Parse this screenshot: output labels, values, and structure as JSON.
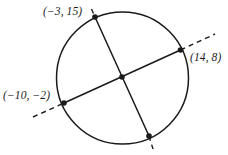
{
  "figure": {
    "name": "circle-with-two-chords",
    "stroke_color": "#1a1a1a",
    "background_color": "#ffffff",
    "circle": {
      "cx": 122.5,
      "cy": 78,
      "r": 66
    },
    "labels": {
      "point_top_left": "(−3, 15)",
      "point_right": "(14, 8)",
      "point_left": "(−10, −2)"
    },
    "points": [
      {
        "name": "point-top-left",
        "x": 95,
        "y": 17,
        "label": "(−3, 15)"
      },
      {
        "name": "point-right",
        "x": 180.5,
        "y": 50,
        "label": "(14, 8)"
      },
      {
        "name": "point-left",
        "x": 64,
        "y": 103,
        "label": "(−10, −2)"
      },
      {
        "name": "point-bottom",
        "x": 149,
        "y": 136,
        "label": ""
      },
      {
        "name": "point-intersection",
        "x": 122,
        "y": 77,
        "label": ""
      }
    ],
    "chords": [
      {
        "name": "chord-top-left-to-bottom",
        "from": {
          "x": 95,
          "y": 17
        },
        "to": {
          "x": 149,
          "y": 136
        },
        "dash_start": {
          "x": 91.5,
          "y": 9
        },
        "dash_end": {
          "x": 153,
          "y": 148
        }
      },
      {
        "name": "chord-left-to-right",
        "from": {
          "x": 64,
          "y": 103
        },
        "to": {
          "x": 180.5,
          "y": 50
        },
        "dash_start": {
          "x": 33,
          "y": 117
        },
        "dash_end": {
          "x": 214,
          "y": 35
        }
      }
    ]
  }
}
